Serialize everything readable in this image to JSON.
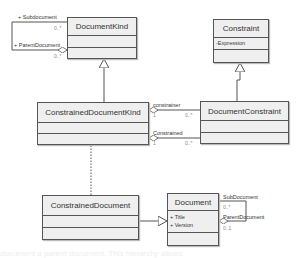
{
  "classes": {
    "document_kind": {
      "name": "DocumentKind",
      "attributes": []
    },
    "constraint": {
      "name": "Constraint",
      "attributes": [
        "-Expression"
      ]
    },
    "constrained_document_kind": {
      "name": "ConstrainedDocumentKind",
      "attributes": []
    },
    "document_constraint": {
      "name": "DocumentConstraint",
      "attributes": []
    },
    "constrained_document": {
      "name": "ConstrainedDocument",
      "attributes": []
    },
    "document": {
      "name": "Document",
      "attributes": [
        "+ Title",
        "+ Version"
      ]
    }
  },
  "associations": {
    "document_kind_self": {
      "sub_role": "+ Subdocument",
      "sub_mult": "0..*",
      "parent_role": "+ ParentDocument",
      "parent_mult": "0..*"
    },
    "constrainer": {
      "role": "constrainer",
      "source_mult": "1",
      "target_mult": "0..*"
    },
    "constrained": {
      "role": "Constrained",
      "source_mult": "1",
      "target_mult": "0..*"
    },
    "document_self": {
      "sub_role": "SubDocument",
      "sub_mult": "0..*",
      "parent_role": "ParentDocument",
      "parent_mult": "0..1"
    }
  },
  "relationships": [
    {
      "type": "generalization",
      "from": "ConstrainedDocumentKind",
      "to": "DocumentKind"
    },
    {
      "type": "generalization",
      "from": "DocumentConstraint",
      "to": "Constraint"
    },
    {
      "type": "generalization",
      "from": "ConstrainedDocument",
      "to": "Document"
    },
    {
      "type": "dependency",
      "from": "ConstrainedDocument",
      "to": "ConstrainedDocumentKind"
    }
  ],
  "background_text": "document a parent document. This hierarchy allows"
}
